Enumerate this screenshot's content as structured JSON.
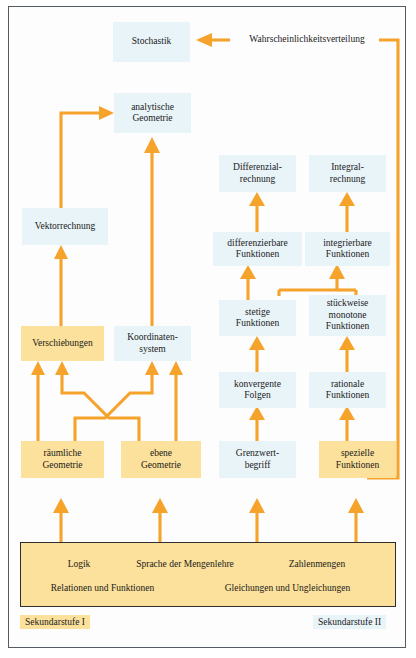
{
  "diagram": {
    "title_region": "Aufbau der Schulmathematik - Sekundarstufe I und II",
    "nodes": {
      "stochastik": "Stochastik",
      "wahrscheinlichkeitsverteilung": "Wahrscheinlichkeitsverteilung",
      "analytische_geometrie": "analytische\nGeometrie",
      "analytische_geometrie_l1": "analytische",
      "analytische_geometrie_l2": "Geometrie",
      "vektorrechnung": "Vektorrechnung",
      "verschiebungen": "Verschiebungen",
      "koordinatensystem_l1": "Koordinaten-",
      "koordinatensystem_l2": "system",
      "raeumliche_geometrie_l1": "räumliche",
      "raeumliche_geometrie_l2": "Geometrie",
      "ebene_geometrie_l1": "ebene",
      "ebene_geometrie_l2": "Geometrie",
      "differenzialrechnung_l1": "Differenzial-",
      "differenzialrechnung_l2": "rechnung",
      "integralrechnung_l1": "Integral-",
      "integralrechnung_l2": "rechnung",
      "differenzierbare_l1": "differenzierbare",
      "differenzierbare_l2": "Funktionen",
      "integrierbare_l1": "integrierbare",
      "integrierbare_l2": "Funktionen",
      "stetige_l1": "stetige",
      "stetige_l2": "Funktionen",
      "stueckweise_l1": "stückweise",
      "stueckweise_l2": "monotone",
      "stueckweise_l3": "Funktionen",
      "konvergente_l1": "konvergente",
      "konvergente_l2": "Folgen",
      "rationale_l1": "rationale",
      "rationale_l2": "Funktionen",
      "grenzwertbegriff_l1": "Grenzwert-",
      "grenzwertbegriff_l2": "begriff",
      "spezielle_l1": "spezielle",
      "spezielle_l2": "Funktionen"
    },
    "base_box": {
      "logik": "Logik",
      "sprache_mengenlehre": "Sprache der Mengenlehre",
      "zahlenmengen": "Zahlenmengen",
      "relationen_funktionen": "Relationen und Funktionen",
      "gleichungen_ungleichungen": "Gleichungen und Ungleichungen"
    },
    "legend": {
      "stufe_1": "Sekundarstufe I",
      "stufe_2": "Sekundarstufe II"
    },
    "colors": {
      "arrow": "#f5a32a",
      "sek1_fill": "#fbe19b",
      "sek2_fill": "#e9f4f8",
      "text": "#1a1a1a",
      "frame_border": "#555b63",
      "base_border": "#2f2f2f"
    }
  }
}
